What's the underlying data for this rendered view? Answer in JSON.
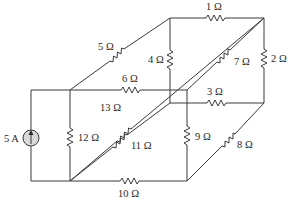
{
  "source": {
    "label": "5 A",
    "type": "current-source",
    "direction": "up"
  },
  "resistors": [
    {
      "id": "R1",
      "label": "1 Ω"
    },
    {
      "id": "R2",
      "label": "2 Ω"
    },
    {
      "id": "R3",
      "label": "3 Ω"
    },
    {
      "id": "R4",
      "label": "4 Ω"
    },
    {
      "id": "R5",
      "label": "5 Ω"
    },
    {
      "id": "R6",
      "label": "6 Ω"
    },
    {
      "id": "R7",
      "label": "7 Ω"
    },
    {
      "id": "R8",
      "label": "8 Ω"
    },
    {
      "id": "R9",
      "label": "9 Ω"
    },
    {
      "id": "R10",
      "label": "10 Ω"
    },
    {
      "id": "R11",
      "label": "11 Ω"
    },
    {
      "id": "R12",
      "label": "12 Ω"
    },
    {
      "id": "R13",
      "label": "13 Ω"
    }
  ]
}
